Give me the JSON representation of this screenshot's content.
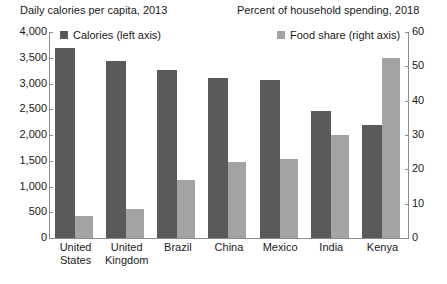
{
  "chart_data": {
    "type": "bar",
    "title": "",
    "left_title": "Daily calories per capita, 2013",
    "right_title": "Percent of household spending, 2018",
    "categories": [
      "United States",
      "United Kingdom",
      "Brazil",
      "China",
      "Mexico",
      "India",
      "Kenya"
    ],
    "series": [
      {
        "name": "Calories (left axis)",
        "axis": "left",
        "color": "#5a5a5a",
        "values": [
          3680,
          3430,
          3270,
          3110,
          3070,
          2460,
          2200
        ]
      },
      {
        "name": "Food share (right axis)",
        "axis": "right",
        "color": "#a3a3a3",
        "values": [
          6.5,
          8.5,
          17,
          22,
          23,
          30,
          52.5
        ]
      }
    ],
    "left_axis": {
      "label": "",
      "ylim": [
        0,
        4000
      ],
      "ticks": [
        0,
        500,
        1000,
        1500,
        2000,
        2500,
        3000,
        3500,
        4000
      ],
      "tick_labels": [
        "0",
        "500",
        "1,000",
        "1,500",
        "2,000",
        "2,500",
        "3,000",
        "3,500",
        "4,000"
      ]
    },
    "right_axis": {
      "label": "",
      "ylim": [
        0,
        60
      ],
      "ticks": [
        0,
        10,
        20,
        30,
        40,
        50,
        60
      ],
      "tick_labels": [
        "0",
        "10",
        "20",
        "30",
        "40",
        "50",
        "60"
      ]
    },
    "xlabel": "",
    "grid": false,
    "legend_position": "top"
  },
  "legend": [
    {
      "label": "Calories (left axis)",
      "color": "#5a5a5a"
    },
    {
      "label": "Food share (right axis)",
      "color": "#a3a3a3"
    }
  ],
  "colors": {
    "calories_bar": "#5a5a5a",
    "foodshare_bar": "#a3a3a3",
    "axis": "#8c8c8c",
    "text": "#1a1a1a",
    "background": "#ffffff"
  }
}
